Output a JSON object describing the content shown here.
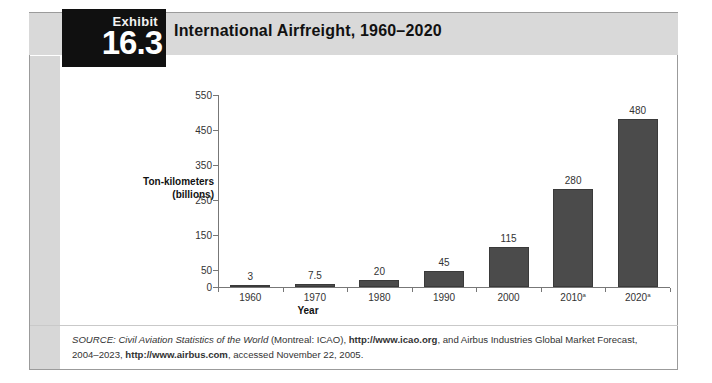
{
  "exhibit": {
    "label": "Exhibit",
    "number": "16.3",
    "title": "International Airfreight, 1960–2020"
  },
  "chart_data": {
    "type": "bar",
    "title": "International Airfreight, 1960–2020",
    "xlabel": "Year",
    "ylabel": "Ton-kilometers (billions)",
    "ylabel_line1": "Ton-kilometers",
    "ylabel_line2": "(billions)",
    "categories": [
      "1960",
      "1970",
      "1980",
      "1990",
      "2000",
      "2010",
      "2020"
    ],
    "category_labels": [
      "1960",
      "1970",
      "1980",
      "1990",
      "2000",
      "2010a",
      "2020a"
    ],
    "footnote_marks": [
      "",
      "",
      "",
      "",
      "",
      "a",
      "a"
    ],
    "values": [
      3,
      7.5,
      20,
      45,
      115,
      280,
      480
    ],
    "value_labels": [
      "3",
      "7.5",
      "20",
      "45",
      "115",
      "280",
      "480"
    ],
    "ylim": [
      0,
      550
    ],
    "yticks": [
      0,
      50,
      150,
      250,
      350,
      450,
      550
    ],
    "ytick_labels": [
      "0",
      "50",
      "150",
      "250",
      "350",
      "450",
      "550"
    ],
    "grid": false,
    "legend": null,
    "bar_color": "#4b4b4b"
  },
  "source": {
    "prefix": "SOURCE:",
    "work": "Civil Aviation Statistics of the World",
    "publisher": " (Montreal: ICAO), ",
    "url1": "http://www.icao.org",
    "middle": ", and Airbus Industries Global Market Forecast, 2004–2023, ",
    "url2": "http://www.airbus.com",
    "suffix": ", accessed November 22, 2005."
  },
  "colors": {
    "header_band": "#d9d9d9",
    "exhibit_tab": "#101010",
    "bar": "#4b4b4b",
    "axis": "#777777"
  }
}
